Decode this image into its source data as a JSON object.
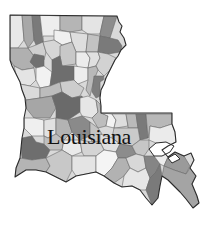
{
  "map": {
    "title": "Louisiana",
    "colors": {
      "outline": "#2b2b2b",
      "parish_border": "#6a6a6a",
      "label": "#111111",
      "background": "#ffffff"
    },
    "outline_path": "M10,15 L117,16 L119,22 L122,26 L120,32 L124,38 L126,45 L121,50 L118,56 L115,60 L112,66 L109,72 L106,78 L104,84 L101,90 L100,98 L101,106 L101,113 L172,113 L172,124 L175,132 L176,142 L168,146 L162,150 L168,157 L175,152 L184,156 L191,153 L194,160 L190,168 L196,176 L192,184 L197,196 L199,203 L193,208 L186,199 L180,192 L174,186 L168,180 L162,176 L160,186 L158,198 L152,205 L146,198 L140,190 L132,186 L122,187 L114,183 L104,176 L96,172 L86,174 L76,176 L66,182 L58,178 L46,172 L36,170 L26,170 L15,177 L16,168 L20,158 L21,148 L22,138 L24,128 L24,118 L26,108 L25,98 L22,90 L20,82 L16,74 L12,66 L10,60 Z",
    "water_paths": [
      "M149,149 L156,143 L166,142 L174,146 L170,152 L162,156 L154,156 Z",
      "M168,158 L175,154 L180,159 L172,163 Z"
    ],
    "parishes": [
      {
        "points": "10,15 22,15 24,40 18,48 10,48",
        "fill": "#e8e8e8"
      },
      {
        "points": "22,15 32,15 34,40 28,48 24,40",
        "fill": "#a8a8a8"
      },
      {
        "points": "32,15 40,15 43,42 36,45 34,40",
        "fill": "#7a7a7a"
      },
      {
        "points": "40,15 60,16 60,30 54,36 43,36 43,42",
        "fill": "#eeeeee"
      },
      {
        "points": "60,16 82,16 82,30 70,32 60,30",
        "fill": "#b5b5b5"
      },
      {
        "points": "82,16 104,16 100,34 88,34 82,30",
        "fill": "#e4e4e4"
      },
      {
        "points": "104,16 117,16 110,38 100,36 100,34",
        "fill": "#8c8c8c"
      },
      {
        "points": "54,30 70,32 72,42 62,45 54,40",
        "fill": "#f0f0f0"
      },
      {
        "points": "70,32 88,34 86,52 76,52 72,42",
        "fill": "#dedede"
      },
      {
        "points": "88,34 100,36 98,52 86,52",
        "fill": "#c2c2c2"
      },
      {
        "points": "100,36 110,38 118,40 122,46 120,52 108,54 98,52",
        "fill": "#7a7a7a"
      },
      {
        "points": "10,48 18,48 28,48 34,56 34,68 22,70 14,66 10,60",
        "fill": "#b0b0b0"
      },
      {
        "points": "28,48 36,45 43,42 46,52 44,60 34,56",
        "fill": "#cfcfcf"
      },
      {
        "points": "43,42 54,40 62,45 60,56 52,60 46,52",
        "fill": "#d6d6d6"
      },
      {
        "points": "34,54 44,56 44,66 36,68 30,62",
        "fill": "#707070"
      },
      {
        "points": "60,46 72,42 76,52 76,64 62,66 60,56",
        "fill": "#c8c8c8"
      },
      {
        "points": "76,52 86,52 90,58 88,68 78,68 76,64",
        "fill": "#ececec"
      },
      {
        "points": "86,52 98,52 100,58 96,66 88,68 90,58",
        "fill": "#e0e0e0"
      },
      {
        "points": "98,52 108,54 116,58 110,70 104,76 98,70 96,66 100,58",
        "fill": "#d2d2d2"
      },
      {
        "points": "14,66 22,70 34,68 36,80 30,86 20,84 16,74",
        "fill": "#e4e4e4"
      },
      {
        "points": "36,68 44,66 52,72 50,86 40,88 36,80",
        "fill": "#f2f2f2"
      },
      {
        "points": "52,60 60,56 62,66 74,66 74,80 60,82 50,86 52,72",
        "fill": "#6e6e6e"
      },
      {
        "points": "74,66 88,68 88,80 78,84 74,80",
        "fill": "#ededed"
      },
      {
        "points": "88,68 96,66 98,70 94,80 90,96 86,90 88,80",
        "fill": "#b9b9b9"
      },
      {
        "points": "94,76 104,76 102,86 100,96 96,98 92,92",
        "fill": "#7e7e7e"
      },
      {
        "points": "100,82 106,78 104,86 102,96 100,100",
        "fill": "#d8d8d8"
      },
      {
        "points": "20,84 30,86 40,88 40,98 26,100 22,90",
        "fill": "#dadada"
      },
      {
        "points": "40,88 50,86 60,82 62,92 52,96 40,98",
        "fill": "#bcbcbc"
      },
      {
        "points": "60,82 74,80 78,84 84,88 80,96 72,98 62,92",
        "fill": "#cdcdcd"
      },
      {
        "points": "26,100 40,98 52,96 56,108 50,118 34,118 26,108",
        "fill": "#a6a6a6"
      },
      {
        "points": "52,96 62,92 72,98 82,96 84,102 80,112 68,120 56,118 56,108",
        "fill": "#6a6a6a"
      },
      {
        "points": "80,98 88,96 96,100 98,112 92,118 82,116 80,112",
        "fill": "#e6e6e6"
      },
      {
        "points": "96,100 100,104 101,113 108,116 106,126 98,128 92,118 98,112",
        "fill": "#bdbdbd"
      },
      {
        "points": "24,118 34,118 44,120 44,136 32,136 24,128",
        "fill": "#efefef"
      },
      {
        "points": "44,120 56,118 56,134 48,138 44,136",
        "fill": "#e2e2e2"
      },
      {
        "points": "56,118 68,120 72,132 64,140 56,134",
        "fill": "#b3b3b3"
      },
      {
        "points": "68,120 82,116 90,122 90,136 80,140 72,132",
        "fill": "#8a8a8a"
      },
      {
        "points": "90,122 98,128 102,134 100,142 92,142 90,136",
        "fill": "#c4c4c4"
      },
      {
        "points": "101,113 112,114 116,120 114,128 106,126 108,116",
        "fill": "#f3f3f3"
      },
      {
        "points": "112,114 126,114 128,126 116,128 114,128 116,120",
        "fill": "#dedede"
      },
      {
        "points": "126,114 136,114 138,128 128,128 128,126",
        "fill": "#bababa"
      },
      {
        "points": "136,114 146,114 148,138 140,140 138,128",
        "fill": "#7a7a7a"
      },
      {
        "points": "146,114 172,114 172,124 160,128 150,126 148,138",
        "fill": "#b8b8b8"
      },
      {
        "points": "150,126 160,128 172,124 175,132 176,142 168,146 156,143 149,140",
        "fill": "#ebebeb"
      },
      {
        "points": "114,128 128,128 138,128 140,140 132,146 120,144 112,138",
        "fill": "#cacaca"
      },
      {
        "points": "100,134 112,138 120,144 116,152 104,150 100,142",
        "fill": "#e0e0e0"
      },
      {
        "points": "22,138 32,136 36,142 44,144 50,150 46,158 32,160 22,158 21,148",
        "fill": "#6e6e6e"
      },
      {
        "points": "44,136 48,138 56,134 64,140 62,150 50,150 44,144",
        "fill": "#bfbfbf"
      },
      {
        "points": "64,140 80,140 82,152 72,156 62,150",
        "fill": "#eaeaea"
      },
      {
        "points": "80,140 92,142 100,142 104,150 96,156 84,156 82,152",
        "fill": "#d4d4d4"
      },
      {
        "points": "116,152 120,144 132,146 136,154 126,158 118,158",
        "fill": "#8c8c8c"
      },
      {
        "points": "132,146 140,140 149,140 149,149 144,156 136,154",
        "fill": "#c6c6c6"
      },
      {
        "points": "20,158 32,160 46,158 50,166 46,172 36,170 26,170 15,177 16,168",
        "fill": "#b4b4b4"
      },
      {
        "points": "46,158 62,150 72,156 72,170 66,182 58,178 46,172 50,166",
        "fill": "#c8c8c8"
      },
      {
        "points": "72,156 84,156 96,156 96,172 86,174 76,176 72,170",
        "fill": "#e4e4e4"
      },
      {
        "points": "96,156 104,150 116,152 118,158 112,168 104,176 96,172",
        "fill": "#f4f4f4"
      },
      {
        "points": "112,168 118,158 126,158 130,168 124,176 114,183 104,176",
        "fill": "#b2b2b2"
      },
      {
        "points": "126,158 136,154 144,156 146,168 138,172 130,168",
        "fill": "#d8d8d8"
      },
      {
        "points": "124,176 130,168 138,172 146,168 150,178 146,190 140,190 132,186 122,187",
        "fill": "#e6e6e6"
      },
      {
        "points": "144,156 154,156 160,164 156,172 150,178 146,168",
        "fill": "#858585"
      },
      {
        "points": "146,190 150,178 156,172 160,164 162,176 160,186 158,198 152,205",
        "fill": "#7a7a7a"
      },
      {
        "points": "154,156 162,150 168,157 164,166 160,164",
        "fill": "#ececec"
      },
      {
        "points": "164,166 168,157 175,152 184,156 190,166 186,174 174,170",
        "fill": "#9a9a9a"
      },
      {
        "points": "162,176 164,166 174,170 186,174 190,168 196,176 192,184 197,196 199,203 193,208 186,199 180,192 174,186 168,180",
        "fill": "#a4a4a4"
      }
    ],
    "label": {
      "text": "Louisiana"
    }
  }
}
